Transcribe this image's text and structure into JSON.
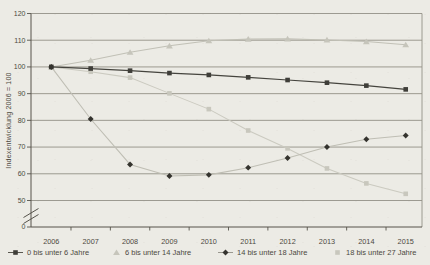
{
  "colors": {
    "background": "#ecebe5",
    "grid": "#939187",
    "axis": "#56534b",
    "text": "#4c4941",
    "legend_line_dark": "#5a5850",
    "legend_line_gray": "#9a988f"
  },
  "chart_data": {
    "type": "line",
    "title": "",
    "xlabel": "",
    "ylabel": "Indexentwicklung 2006 = 100",
    "categories": [
      "2006",
      "2007",
      "2008",
      "2009",
      "2010",
      "2011",
      "2012",
      "2013",
      "2014",
      "2015"
    ],
    "yticks": [
      120,
      110,
      100,
      90,
      80,
      70,
      60,
      50
    ],
    "baseline_tick_label": "0",
    "axis_break": true,
    "ylim": [
      50,
      120
    ],
    "grid": true,
    "legend_position": "bottom",
    "series": [
      {
        "name": "0 bis unter 6 Jahre",
        "marker": "square",
        "marker_color": "#3f3e39",
        "line_color": "#45443e",
        "values": [
          100,
          99.4,
          98.6,
          97.7,
          97.0,
          96.1,
          95.1,
          94.1,
          93.0,
          91.6
        ]
      },
      {
        "name": "6 bis unter 14 Jahre",
        "marker": "triangle",
        "marker_color": "#c6c5bb",
        "line_color": "#c1c0b6",
        "values": [
          100,
          102.5,
          105.5,
          107.9,
          109.8,
          110.4,
          110.5,
          110.1,
          109.5,
          108.3
        ]
      },
      {
        "name": "14 bis unter 18 Jahre",
        "marker": "diamond",
        "marker_color": "#34332e",
        "line_color": "#bfbeb4",
        "values": [
          100,
          80.5,
          63.5,
          59.2,
          59.6,
          62.3,
          65.9,
          70.0,
          72.9,
          74.3
        ]
      },
      {
        "name": "18 bis unter 27 Jahre",
        "marker": "square",
        "marker_color": "#c8c7bd",
        "line_color": "#cbcac0",
        "values": [
          100,
          98.2,
          96.0,
          90.1,
          84.2,
          76.2,
          69.5,
          62.0,
          56.4,
          52.5
        ]
      }
    ]
  }
}
